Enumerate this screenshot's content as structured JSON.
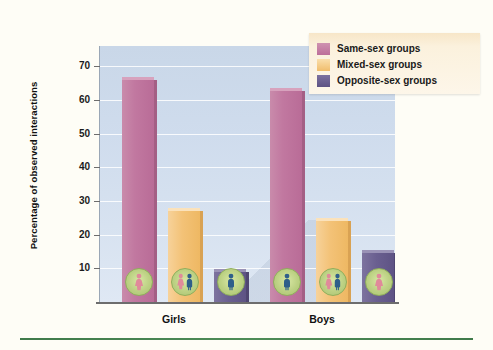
{
  "chart_data": {
    "type": "bar",
    "title": "",
    "subtitle": "",
    "xlabel": "",
    "ylabel": "Percentage of observed interactions",
    "categories": [
      "Girls",
      "Boys"
    ],
    "series": [
      {
        "name": "Same-sex groups",
        "color": "#c27a9e",
        "values": [
          66,
          62.5
        ]
      },
      {
        "name": "Mixed-sex groups",
        "color": "#f2c277",
        "values": [
          27,
          24
        ]
      },
      {
        "name": "Opposite-sex groups",
        "color": "#6b5f91",
        "values": [
          9,
          14.5
        ]
      }
    ],
    "ylim": [
      0,
      76
    ],
    "yticks": [
      10,
      20,
      30,
      40,
      50,
      60,
      70
    ],
    "ytick_labels": [
      "10",
      "20",
      "30",
      "40",
      "50",
      "60",
      "70"
    ],
    "grid": true,
    "legend_position": "top-right"
  },
  "legend": {
    "items": [
      {
        "label": "Same-sex groups",
        "swatch": "swatch-pink"
      },
      {
        "label": "Mixed-sex groups",
        "swatch": "swatch-orange"
      },
      {
        "label": "Opposite-sex groups",
        "swatch": "swatch-purple"
      }
    ]
  },
  "axis": {
    "y_title": "Percentage of observed interactions",
    "y_labels": [
      "70",
      "60",
      "50",
      "40",
      "30",
      "20",
      "10"
    ],
    "x_labels": [
      "Girls",
      "Boys"
    ]
  },
  "icons": {
    "girls": [
      "female-figure-icon",
      "mixed-figures-icon",
      "male-figure-icon"
    ],
    "boys": [
      "male-figure-icon",
      "mixed-figures-icon",
      "female-figure-icon"
    ]
  },
  "colors": {
    "same_sex": "#c27a9e",
    "mixed_sex": "#f2c277",
    "opposite_sex": "#6b5f91",
    "plot_background": "#d2dded",
    "legend_background": "#fbf1dd",
    "rule": "#4e8c57"
  }
}
